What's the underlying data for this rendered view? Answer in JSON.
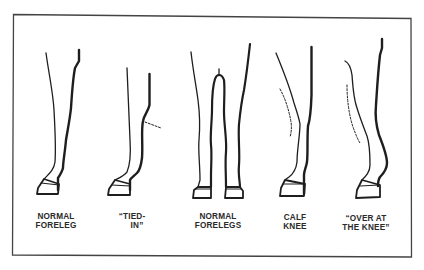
{
  "figure": {
    "colors": {
      "ink": "#1e1e1e",
      "frame": "#444444",
      "background": "#ffffff"
    },
    "panels": [
      {
        "id": "normal-foreleg",
        "label_lines": [
          "NORMAL",
          "FORELEG"
        ]
      },
      {
        "id": "tied-in",
        "label_lines": [
          "“TIED-",
          "IN”"
        ]
      },
      {
        "id": "normal-forelegs",
        "label_lines": [
          "NORMAL",
          "FORELEGS"
        ]
      },
      {
        "id": "calf-knee",
        "label_lines": [
          "CALF",
          "KNEE"
        ]
      },
      {
        "id": "over-at-the-knee",
        "label_lines": [
          "“OVER AT",
          "THE KNEE”"
        ]
      }
    ]
  }
}
